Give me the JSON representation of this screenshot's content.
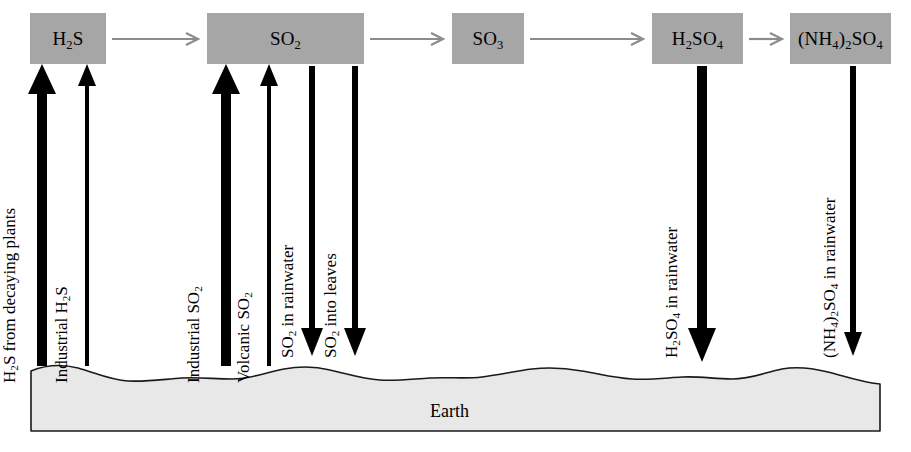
{
  "diagram": {
    "ground_label": "Earth",
    "box_fill": "#a6a6a6",
    "ground_fill": "#e8e8e8",
    "connector_color": "#8c8c8c",
    "arrow_color": "#000000"
  },
  "boxes": [
    {
      "id": "h2s",
      "label_html": "H<sub>2</sub>S"
    },
    {
      "id": "so2",
      "label_html": "SO<sub>2</sub>"
    },
    {
      "id": "so3",
      "label_html": "SO<sub>3</sub>"
    },
    {
      "id": "h2so4",
      "label_html": "H<sub>2</sub>SO<sub>4</sub>"
    },
    {
      "id": "nh4_2so4",
      "label_html": "(NH<sub>4</sub>)<sub>2</sub>SO<sub>4</sub>"
    }
  ],
  "fluxes": [
    {
      "id": "h2s-decaying",
      "label_html": "H<sub>2</sub>S from decaying plants",
      "direction": "up",
      "weight": "thick"
    },
    {
      "id": "h2s-industrial",
      "label_html": "Industrial H<sub>2</sub>S",
      "direction": "up",
      "weight": "thin"
    },
    {
      "id": "so2-industrial",
      "label_html": "Industrial SO<sub>2</sub>",
      "direction": "up",
      "weight": "thick"
    },
    {
      "id": "so2-volcanic",
      "label_html": "Volcanic SO<sub>2</sub>",
      "direction": "up",
      "weight": "thin"
    },
    {
      "id": "so2-rainwater",
      "label_html": "SO<sub>2</sub>  in rainwater",
      "direction": "down",
      "weight": "medium"
    },
    {
      "id": "so2-leaves",
      "label_html": "SO<sub>2</sub>  into leaves",
      "direction": "down",
      "weight": "medium"
    },
    {
      "id": "h2so4-rainwater",
      "label_html": "H<sub>2</sub>SO<sub>4</sub>  in rainwater",
      "direction": "down",
      "weight": "thick"
    },
    {
      "id": "nh4so4-rainwater",
      "label_html": "(NH<sub>4</sub>)<sub>2</sub>SO<sub>4</sub>  in rainwater",
      "direction": "down",
      "weight": "thin"
    }
  ],
  "connectors": [
    {
      "id": "h2s-to-so2",
      "from": "h2s",
      "to": "so2"
    },
    {
      "id": "so2-to-so3",
      "from": "so2",
      "to": "so3"
    },
    {
      "id": "so3-to-h2so4",
      "from": "so3",
      "to": "h2so4"
    },
    {
      "id": "h2so4-to-nh4_2so4",
      "from": "h2so4",
      "to": "nh4_2so4"
    }
  ]
}
